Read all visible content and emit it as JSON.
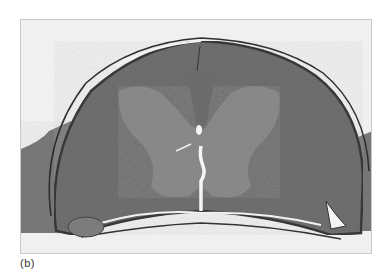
{
  "figure": {
    "panel_label": "(b)",
    "colors": {
      "background": "#f0f0f0",
      "white_matter": "#707070",
      "gray_matter": "#8c8c8c",
      "membrane": "#3a3a3a",
      "frame": "#c8c8c8"
    }
  }
}
